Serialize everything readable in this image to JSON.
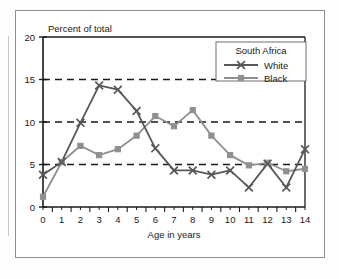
{
  "figure": {
    "title_label": "Percent of total",
    "xlabel": "Age in years"
  },
  "legend": {
    "title": "South Africa",
    "entries": [
      {
        "label": "White",
        "marker": "x-marker-icon",
        "color": "#575757"
      },
      {
        "label": "Black",
        "marker": "square-marker-icon",
        "color": "#8f8f8f"
      }
    ]
  },
  "colors": {
    "white_series": "#575757",
    "black_series": "#8f8f8f",
    "axis": "#1a1a1a",
    "gridline": "#1a1a1a",
    "frame": "#8d8d8d",
    "background": "#ffffff"
  },
  "chart_data": {
    "type": "line",
    "title": "Percent of total",
    "xlabel": "Age in years",
    "ylabel": "Percent of total",
    "x": [
      0,
      1,
      2,
      3,
      4,
      5,
      6,
      7,
      8,
      9,
      10,
      11,
      12,
      13,
      14
    ],
    "xlim": [
      0,
      14
    ],
    "ylim": [
      0,
      20
    ],
    "yticks": [
      0,
      5,
      10,
      15,
      20
    ],
    "xticks": [
      0,
      1,
      2,
      3,
      4,
      5,
      6,
      7,
      8,
      9,
      10,
      11,
      12,
      13,
      14
    ],
    "xtick_labels": [
      "0",
      "1",
      "2",
      "3",
      "4",
      "5",
      "6",
      "7",
      "8",
      "9",
      "10",
      "11",
      "12",
      "13",
      "14"
    ],
    "ytick_labels": [
      "0",
      "5",
      "10",
      "15",
      "20"
    ],
    "grid": "horizontal-dashed-at-5-10-15",
    "legend_position": "upper-right-inside",
    "series": [
      {
        "name": "White",
        "marker": "x",
        "color": "#575757",
        "values": [
          3.8,
          5.3,
          9.9,
          14.3,
          13.8,
          11.3,
          6.9,
          4.3,
          4.3,
          3.8,
          4.3,
          2.3,
          5.1,
          2.3,
          6.8
        ]
      },
      {
        "name": "Black",
        "marker": "square",
        "color": "#8f8f8f",
        "values": [
          1.2,
          5.3,
          7.2,
          6.1,
          6.8,
          8.4,
          10.7,
          9.5,
          11.4,
          8.4,
          6.1,
          4.9,
          5.2,
          4.2,
          4.5
        ]
      }
    ]
  }
}
